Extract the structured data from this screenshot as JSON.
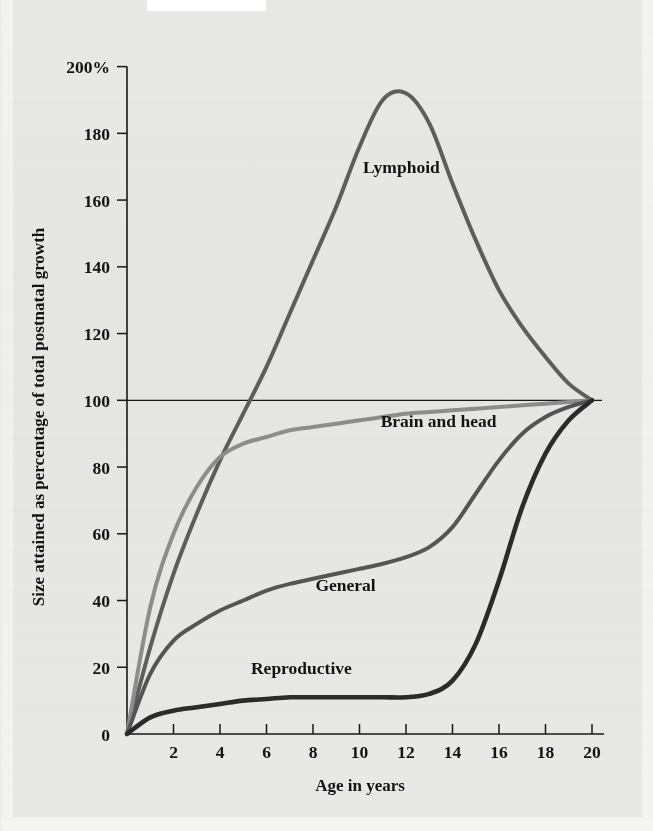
{
  "figure": {
    "background_color": "#e8e8e6",
    "ink_color": "#131313"
  },
  "chart_data": {
    "type": "line",
    "title": "",
    "xlabel": "Age in years",
    "ylabel": "Size attained as percentage of total postnatal growth",
    "xlim": [
      0,
      20
    ],
    "ylim": [
      0,
      200
    ],
    "grid": false,
    "legend": "inline-labels",
    "reference_lines": [
      {
        "axis": "y",
        "value": 100
      }
    ],
    "x_ticks": [
      0,
      2,
      4,
      6,
      8,
      10,
      12,
      14,
      16,
      18,
      20
    ],
    "x_tick_labels": [
      "0",
      "2",
      "4",
      "6",
      "8",
      "10",
      "12",
      "14",
      "16",
      "18",
      "20"
    ],
    "y_ticks": [
      0,
      20,
      40,
      60,
      80,
      100,
      120,
      140,
      160,
      180,
      200
    ],
    "y_tick_labels": [
      "0",
      "20",
      "40",
      "60",
      "80",
      "100",
      "120",
      "140",
      "160",
      "180",
      "200%"
    ],
    "x": [
      0,
      1,
      2,
      3,
      4,
      5,
      6,
      7,
      8,
      9,
      10,
      11,
      12,
      13,
      14,
      15,
      16,
      17,
      18,
      19,
      20
    ],
    "series": [
      {
        "name": "Lymphoid",
        "color": "#5e5e5e",
        "stroke_width": 4.0,
        "label_position": {
          "x": 11.8,
          "y": 168
        },
        "values": [
          0,
          26,
          48,
          66,
          82,
          96,
          110,
          126,
          142,
          158,
          176,
          190,
          192,
          183,
          165,
          148,
          133,
          122,
          113,
          105,
          100
        ]
      },
      {
        "name": "Brain and head",
        "color": "#8e8e8e",
        "stroke_width": 4.0,
        "label_position": {
          "x": 13.4,
          "y": 92
        },
        "values": [
          0,
          38,
          60,
          74,
          83,
          87,
          89,
          91,
          92,
          93,
          94,
          95,
          96,
          96.5,
          97,
          97.5,
          98,
          98.5,
          99,
          99.5,
          100
        ]
      },
      {
        "name": "General",
        "color": "#555555",
        "stroke_width": 4.0,
        "label_position": {
          "x": 9.4,
          "y": 43
        },
        "values": [
          0,
          18,
          28,
          33,
          37,
          40,
          43,
          45,
          46.5,
          48,
          49.5,
          51,
          53,
          56,
          62,
          72,
          82,
          90,
          95,
          98,
          100
        ]
      },
      {
        "name": "Reproductive",
        "color": "#2b2b2b",
        "stroke_width": 4.6,
        "label_position": {
          "x": 7.5,
          "y": 18
        },
        "values": [
          0,
          5,
          7,
          8,
          9,
          10,
          10.5,
          11,
          11,
          11,
          11,
          11,
          11,
          12,
          16,
          27,
          46,
          68,
          84,
          94,
          100
        ]
      }
    ]
  }
}
